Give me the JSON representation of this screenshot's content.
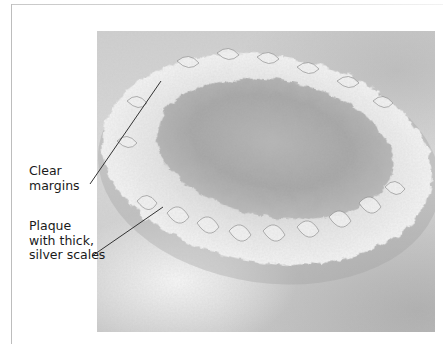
{
  "figure": {
    "labels": [
      {
        "id": "clear-margins",
        "lines": [
          "Clear",
          "margins"
        ]
      },
      {
        "id": "plaque-scales",
        "lines": [
          "Plaque",
          "with thick,",
          "silver scales"
        ]
      }
    ]
  },
  "colors": {
    "frame": "#bdbdbd",
    "skin_background": "#d0d0d0",
    "plaque_center": "#a8a8a8",
    "scale_rim": "#ececec",
    "text": "#1a1a1a",
    "leader_line": "#333333"
  },
  "icons": {
    "photo": "lesion-photo"
  }
}
